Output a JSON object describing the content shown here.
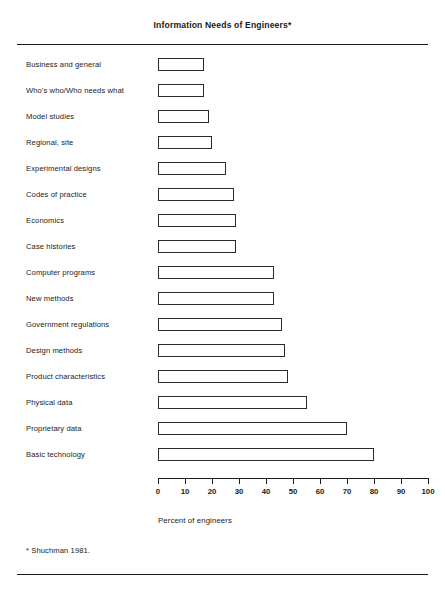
{
  "chart_data": {
    "type": "bar",
    "orientation": "horizontal",
    "title": "Information Needs of Engineers*",
    "xlabel": "Percent of engineers",
    "ylabel": "",
    "xlim": [
      0,
      100
    ],
    "xticks": [
      0,
      10,
      20,
      30,
      40,
      50,
      60,
      70,
      80,
      90,
      100
    ],
    "grid": false,
    "legend": null,
    "footnote": "* Shuchman 1981.",
    "categories": [
      "Business and general",
      "Who's who/Who needs what",
      "Model studies",
      "Regional, site",
      "Experimental designs",
      "Codes of practice",
      "Economics",
      "Case histories",
      "Computer programs",
      "New methods",
      "Government regulations",
      "Design methods",
      "Product characteristics",
      "Physical data",
      "Proprietary data",
      "Basic technology"
    ],
    "values": [
      17,
      17,
      19,
      20,
      25,
      28,
      29,
      29,
      43,
      43,
      46,
      47,
      48,
      55,
      70,
      80
    ],
    "bar_style": {
      "fill": "#ffffff",
      "stroke": "#2a2a2a"
    }
  },
  "axis": {
    "tick_labels": [
      "0",
      "10",
      "20",
      "30",
      "40",
      "50",
      "60",
      "70",
      "80",
      "90",
      "100"
    ],
    "title": "Percent of engineers"
  },
  "header": {
    "title": "Information Needs of Engineers*"
  },
  "footer": {
    "footnote": "* Shuchman 1981."
  }
}
